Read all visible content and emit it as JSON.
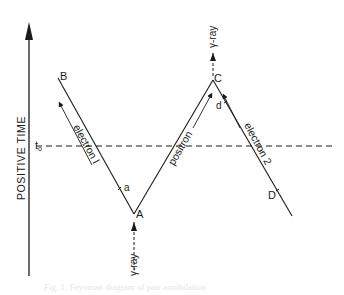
{
  "diagram": {
    "axis_label": "POSITIVE TIME",
    "time_marker": "t",
    "time_marker_sub": "o",
    "points": {
      "A": "A",
      "B": "B",
      "C": "C",
      "D": "D"
    },
    "lines": {
      "electron1": "electron l",
      "positron": "positron",
      "electron2": "electron 2",
      "gamma_in": "γ-ray",
      "gamma_out": "γ-ray"
    },
    "tick_labels": {
      "a": "a",
      "d": "d"
    },
    "caption": "Fig. 1.  Feynman diagram of pair annihilation"
  },
  "colors": {
    "ink": "#1a1a1a",
    "background": "#ffffff"
  }
}
